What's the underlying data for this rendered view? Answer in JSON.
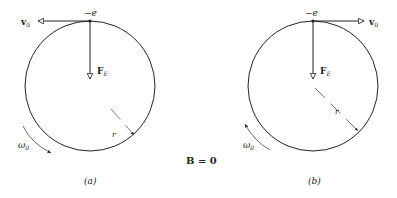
{
  "figure": {
    "panel_a": {
      "caption": "(a)",
      "charge_label": "−e",
      "velocity_label": "v",
      "velocity_sub": "0",
      "force_label": "F",
      "force_sub": "E",
      "radius_label": "r",
      "omega_label": "ω",
      "omega_sub": "0",
      "velocity_direction": "left",
      "rotation_direction": "counterclockwise-down"
    },
    "panel_b": {
      "caption": "(b)",
      "charge_label": "−e",
      "velocity_label": "v",
      "velocity_sub": "0",
      "force_label": "F",
      "force_sub": "E",
      "radius_label": "r",
      "omega_label": "ω",
      "omega_sub": "0",
      "velocity_direction": "right",
      "rotation_direction": "clockwise-up"
    },
    "center_label": "B = 0",
    "colors": {
      "stroke": "#222222",
      "background": "#ffffff"
    }
  }
}
